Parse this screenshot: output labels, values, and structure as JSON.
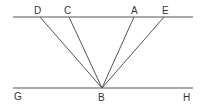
{
  "diagram": {
    "labels": {
      "D": "D",
      "C": "C",
      "A": "A",
      "E": "E",
      "G": "G",
      "B": "B",
      "H": "H"
    },
    "points": {
      "D": [
        40,
        17
      ],
      "C": [
        69,
        17
      ],
      "A": [
        134,
        17
      ],
      "E": [
        164,
        17
      ],
      "B": [
        102,
        88
      ],
      "G": [
        13,
        88
      ],
      "H": [
        193,
        88
      ]
    },
    "lines": [
      {
        "name": "top-line",
        "from": [
          13,
          17
        ],
        "to": [
          193,
          17
        ]
      },
      {
        "name": "line-GH",
        "from": [
          13,
          88
        ],
        "to": [
          193,
          88
        ]
      },
      {
        "name": "segment-DB",
        "from": "D",
        "to": "B"
      },
      {
        "name": "segment-CB",
        "from": "C",
        "to": "B"
      },
      {
        "name": "segment-AB",
        "from": "A",
        "to": "B"
      },
      {
        "name": "segment-EB",
        "from": "E",
        "to": "B"
      }
    ],
    "stroke_color": "#555555",
    "text_color": "#333333"
  }
}
